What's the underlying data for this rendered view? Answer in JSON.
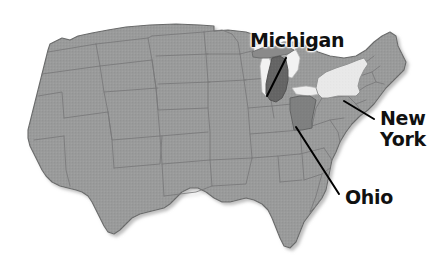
{
  "figure": {
    "kind": "map",
    "background_color": "#ffffff"
  },
  "map": {
    "region": "Contiguous United States",
    "base_state_fill": "#9a9b9b",
    "base_state_border": "#6f7070",
    "coast_outline": "#6a6b6b",
    "lake_fill": "#f4f4f4",
    "texture": "halftone-dither",
    "shadow_color": "#c8c8c8"
  },
  "highlights": [
    {
      "id": "michigan",
      "name": "Michigan",
      "fill": "#656565",
      "shade": "dark-gray",
      "label_text": "Michigan"
    },
    {
      "id": "new-york",
      "name": "New York",
      "fill": "#e9e9e9",
      "shade": "light-gray",
      "label_text": "New\nYork"
    },
    {
      "id": "ohio",
      "name": "Ohio",
      "fill": "#7f8080",
      "shade": "medium-gray",
      "label_text": "Ohio"
    }
  ],
  "leader_lines": {
    "color": "#000000",
    "width": 2,
    "items": [
      {
        "id": "michigan",
        "from": [
          286,
          58
        ],
        "to": [
          267,
          96
        ]
      },
      {
        "id": "new-york",
        "from": [
          374,
          119
        ],
        "to": [
          344,
          101
        ]
      },
      {
        "id": "ohio",
        "from": [
          339,
          194
        ],
        "to": [
          296,
          127
        ]
      }
    ]
  }
}
